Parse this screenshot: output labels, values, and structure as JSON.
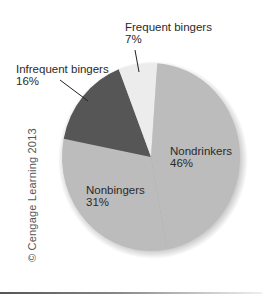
{
  "chart_data": {
    "type": "pie",
    "title": "",
    "slices": [
      {
        "label": "Nondrinkers",
        "value": 46,
        "value_label": "46%",
        "color": "#bcbcbc"
      },
      {
        "label": "Nonbingers",
        "value": 31,
        "value_label": "31%",
        "color": "#bcbcbc"
      },
      {
        "label": "Infrequent bingers",
        "value": 16,
        "value_label": "16%",
        "color": "#565656"
      },
      {
        "label": "Frequent bingers",
        "value": 7,
        "value_label": "7%",
        "color": "#ececec"
      }
    ],
    "start_angle_deg_clockwise_from_top": 4,
    "legend": "none (direct labels)"
  },
  "labels": {
    "nondrinkers": {
      "name": "Nondrinkers",
      "pct": "46%"
    },
    "nonbingers": {
      "name": "Nonbingers",
      "pct": "31%"
    },
    "infrequent": {
      "name": "Infrequent bingers",
      "pct": "16%"
    },
    "frequent": {
      "name": "Frequent bingers",
      "pct": "7%"
    }
  },
  "copyright": "© Cengage Learning 2013"
}
